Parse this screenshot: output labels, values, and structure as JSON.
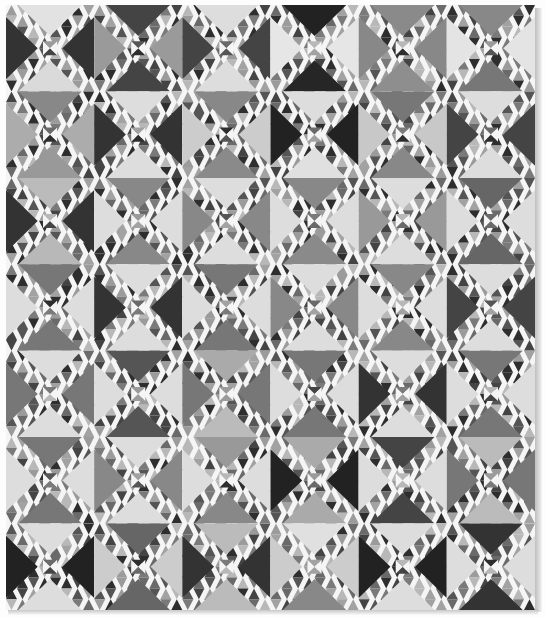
{
  "image": {
    "subject": "Ocean Waves pieced quilt, black-and-white photograph",
    "description": "Quilt laid flat on white background with drop shadow along right and bottom edges",
    "grid": {
      "columns": 6,
      "rows": 7
    },
    "palette": {
      "background": "#ffffff",
      "seam_white": "#f5f5f5",
      "light": "#dcdcdc",
      "light_plaid": "#c4c4c4",
      "mid_light": "#a8a8a8",
      "mid": "#888888",
      "mid_dark": "#666666",
      "dark": "#3a3a3a",
      "very_dark": "#242424"
    },
    "blocks": [
      [
        {
          "top": "#e2e2e2",
          "right": "#333333",
          "bottom": "#dadada",
          "left": "#333333"
        },
        {
          "top": "#444444",
          "right": "#9a9a9a",
          "bottom": "#444444",
          "left": "#9a9a9a"
        },
        {
          "top": "#dddddd",
          "right": "#444444",
          "bottom": "#dddddd",
          "left": "#444444"
        },
        {
          "top": "#222222",
          "right": "#e6e6e6",
          "bottom": "#262626",
          "left": "#e6e6e6"
        },
        {
          "top": "#8a8a8a",
          "right": "#888888",
          "bottom": "#8e8e8e",
          "left": "#888888"
        },
        {
          "top": "#888888",
          "right": "#e4e4e4",
          "bottom": "#777777",
          "left": "#e4e4e4"
        }
      ],
      [
        {
          "top": "#888888",
          "right": "#acacac",
          "bottom": "#999999",
          "left": "#acacac"
        },
        {
          "top": "#dddddd",
          "right": "#333333",
          "bottom": "#dddddd",
          "left": "#333333"
        },
        {
          "top": "#888888",
          "right": "#cccccc",
          "bottom": "#8a8a8a",
          "left": "#cccccc"
        },
        {
          "top": "#dddddd",
          "right": "#222222",
          "bottom": "#e0e0e0",
          "left": "#222222"
        },
        {
          "top": "#777777",
          "right": "#c8c8c8",
          "bottom": "#888888",
          "left": "#c8c8c8"
        },
        {
          "top": "#dddddd",
          "right": "#444444",
          "bottom": "#dddddd",
          "left": "#444444"
        }
      ],
      [
        {
          "top": "#bbbbbb",
          "right": "#333333",
          "bottom": "#b8b8b8",
          "left": "#333333"
        },
        {
          "top": "#888888",
          "right": "#dddddd",
          "bottom": "#888888",
          "left": "#dddddd"
        },
        {
          "top": "#dddddd",
          "right": "#888888",
          "bottom": "#dddddd",
          "left": "#888888"
        },
        {
          "top": "#888888",
          "right": "#dddddd",
          "bottom": "#8a8a8a",
          "left": "#dddddd"
        },
        {
          "top": "#dddddd",
          "right": "#999999",
          "bottom": "#dddddd",
          "left": "#999999"
        },
        {
          "top": "#666666",
          "right": "#dddddd",
          "bottom": "#666666",
          "left": "#dddddd"
        }
      ],
      [
        {
          "top": "#777777",
          "right": "#dddddd",
          "bottom": "#777777",
          "left": "#dddddd"
        },
        {
          "top": "#dddddd",
          "right": "#333333",
          "bottom": "#dddddd",
          "left": "#333333"
        },
        {
          "top": "#777777",
          "right": "#dddddd",
          "bottom": "#777777",
          "left": "#dddddd"
        },
        {
          "top": "#dddddd",
          "right": "#888888",
          "bottom": "#dddddd",
          "left": "#888888"
        },
        {
          "top": "#888888",
          "right": "#dddddd",
          "bottom": "#888888",
          "left": "#dddddd"
        },
        {
          "top": "#dddddd",
          "right": "#444444",
          "bottom": "#dddddd",
          "left": "#444444"
        }
      ],
      [
        {
          "top": "#dddddd",
          "right": "#777777",
          "bottom": "#dddddd",
          "left": "#777777"
        },
        {
          "top": "#555555",
          "right": "#dddddd",
          "bottom": "#555555",
          "left": "#dddddd"
        },
        {
          "top": "#aaaaaa",
          "right": "#777777",
          "bottom": "#bbbbbb",
          "left": "#777777"
        },
        {
          "top": "#777777",
          "right": "#dddddd",
          "bottom": "#777777",
          "left": "#dddddd"
        },
        {
          "top": "#dddddd",
          "right": "#333333",
          "bottom": "#dddddd",
          "left": "#333333"
        },
        {
          "top": "#777777",
          "right": "#dddddd",
          "bottom": "#777777",
          "left": "#dddddd"
        }
      ],
      [
        {
          "top": "#777777",
          "right": "#dddddd",
          "bottom": "#777777",
          "left": "#dddddd"
        },
        {
          "top": "#dddddd",
          "right": "#888888",
          "bottom": "#dddddd",
          "left": "#888888"
        },
        {
          "top": "#999999",
          "right": "#dddddd",
          "bottom": "#888888",
          "left": "#dddddd"
        },
        {
          "top": "#aaaaaa",
          "right": "#222222",
          "bottom": "#aaaaaa",
          "left": "#222222"
        },
        {
          "top": "#444444",
          "right": "#dddddd",
          "bottom": "#444444",
          "left": "#dddddd"
        },
        {
          "top": "#bbbbbb",
          "right": "#777777",
          "bottom": "#bbbbbb",
          "left": "#777777"
        }
      ],
      [
        {
          "top": "#dddddd",
          "right": "#222222",
          "bottom": "#dddddd",
          "left": "#222222"
        },
        {
          "top": "#666666",
          "right": "#cccccc",
          "bottom": "#666666",
          "left": "#cccccc"
        },
        {
          "top": "#bbbbbb",
          "right": "#333333",
          "bottom": "#bbbbbb",
          "left": "#333333"
        },
        {
          "top": "#e0e0e0",
          "right": "#cccccc",
          "bottom": "#888888",
          "left": "#cccccc"
        },
        {
          "top": "#dddddd",
          "right": "#222222",
          "bottom": "#dddddd",
          "left": "#222222"
        },
        {
          "top": "#333333",
          "right": "#dddddd",
          "bottom": "#333333",
          "left": "#dddddd"
        }
      ]
    ],
    "small_triangle_tones": [
      "#2e2e2e",
      "#555555",
      "#7a7a7a",
      "#9b9b9b",
      "#b8b8b8",
      "#6a6a6a",
      "#444444",
      "#a2a2a2"
    ]
  }
}
